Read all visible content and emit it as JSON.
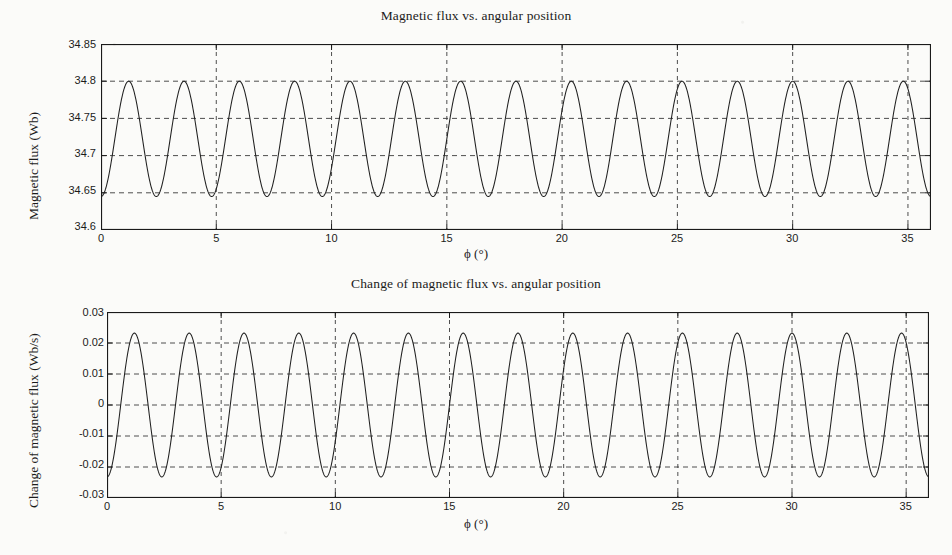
{
  "figure": {
    "background": "#fbfbf9",
    "line_color": "#202020",
    "grid_color": "#3a3a3a",
    "axis_color": "#1a1a1a"
  },
  "chart_data": [
    {
      "type": "line",
      "title": "Magnetic flux vs. angular position",
      "xlabel": "ϕ (°)",
      "ylabel": "Magnetic flux (Wb)",
      "xlim": [
        0,
        36
      ],
      "ylim": [
        34.6,
        34.85
      ],
      "xticks": [
        0,
        5,
        10,
        15,
        20,
        25,
        30,
        35
      ],
      "xticklabels": [
        "0",
        "5",
        "10",
        "15",
        "20",
        "25",
        "30",
        "35"
      ],
      "yticks": [
        34.6,
        34.65,
        34.7,
        34.75,
        34.8,
        34.85
      ],
      "yticklabels": [
        "34.6",
        "34.65",
        "34.7",
        "34.75",
        "34.8",
        "34.85"
      ],
      "grid": true,
      "grid_style": "dashed",
      "legend": null,
      "series": [
        {
          "name": "Magnetic flux",
          "waveform": "sine",
          "offset": 34.7225,
          "amplitude": 0.0775,
          "period_deg": 2.4,
          "phase_deg": 180,
          "n_cycles": 15,
          "ymin": 34.645,
          "ymax": 34.8,
          "color": "#202020"
        }
      ]
    },
    {
      "type": "line",
      "title": "Change of magnetic flux vs. angular position",
      "xlabel": "ϕ (°)",
      "ylabel": "Change of magnetic flux (Wb/s)",
      "xlim": [
        0,
        36
      ],
      "ylim": [
        -0.03,
        0.03
      ],
      "xticks": [
        0,
        5,
        10,
        15,
        20,
        25,
        30,
        35
      ],
      "xticklabels": [
        "0",
        "5",
        "10",
        "15",
        "20",
        "25",
        "30",
        "35"
      ],
      "yticks": [
        -0.03,
        -0.02,
        -0.01,
        0,
        0.01,
        0.02,
        0.03
      ],
      "yticklabels": [
        "-0.03",
        "-0.02",
        "-0.01",
        "0",
        "0.01",
        "0.02",
        "0.03"
      ],
      "grid": true,
      "grid_style": "dashed",
      "legend": null,
      "series": [
        {
          "name": "Change of magnetic flux",
          "waveform": "sine",
          "offset": 0,
          "amplitude": 0.0232,
          "period_deg": 2.4,
          "phase_deg": 180,
          "n_cycles": 15,
          "ymin": -0.0232,
          "ymax": 0.0232,
          "color": "#202020"
        }
      ]
    }
  ]
}
